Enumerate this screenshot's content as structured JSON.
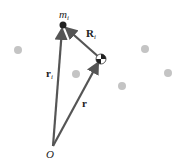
{
  "diagram": {
    "labels": {
      "mass": "m",
      "mass_sub": "i",
      "relative_vector": "R",
      "relative_sub": "i",
      "position_vector": "r",
      "position_sub": "i",
      "com_vector": "r",
      "origin": "O"
    },
    "colors": {
      "vector": "#555555",
      "particle": "#bbbbbb",
      "mass_dot": "#222222"
    },
    "points": {
      "origin": [
        53,
        146
      ],
      "mass_i": [
        63,
        25
      ],
      "center_of_mass": [
        101,
        59
      ],
      "particles": [
        [
          18,
          50
        ],
        [
          76,
          74
        ],
        [
          122,
          86
        ],
        [
          145,
          49
        ],
        [
          168,
          73
        ]
      ]
    }
  }
}
